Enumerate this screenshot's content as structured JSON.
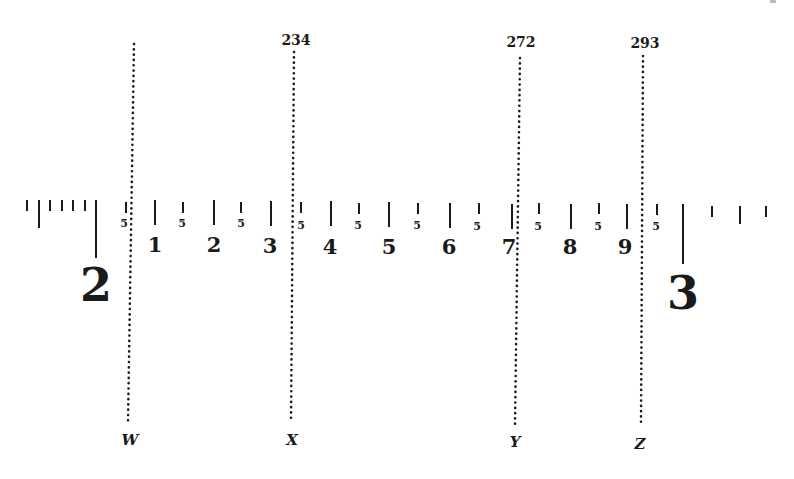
{
  "diagram": {
    "type": "scale-with-markers",
    "major_labels": [
      {
        "label": "2",
        "x": 95
      },
      {
        "label": "3",
        "x": 682
      }
    ],
    "minor_numbered": [
      {
        "label": "1",
        "x": 154
      },
      {
        "label": "2",
        "x": 213
      },
      {
        "label": "3",
        "x": 270
      },
      {
        "label": "4",
        "x": 330
      },
      {
        "label": "5",
        "x": 388
      },
      {
        "label": "6",
        "x": 449
      },
      {
        "label": "7",
        "x": 511
      },
      {
        "label": "8",
        "x": 570
      },
      {
        "label": "9",
        "x": 626
      }
    ],
    "half_ticks": [
      {
        "label": "5",
        "x": 125
      },
      {
        "label": "5",
        "x": 182
      },
      {
        "label": "5",
        "x": 240
      },
      {
        "label": "5",
        "x": 300
      },
      {
        "label": "5",
        "x": 358
      },
      {
        "label": "5",
        "x": 417
      },
      {
        "label": "5",
        "x": 478
      },
      {
        "label": "5",
        "x": 538
      },
      {
        "label": "5",
        "x": 598
      },
      {
        "label": "5",
        "x": 656
      }
    ],
    "markers": [
      {
        "letter": "W",
        "value": "",
        "x_top": 134,
        "x_bottom": 128
      },
      {
        "letter": "X",
        "value": "234",
        "x_top": 294,
        "x_bottom": 291
      },
      {
        "letter": "Y",
        "value": "272",
        "x_top": 520,
        "x_bottom": 515
      },
      {
        "letter": "Z",
        "value": "293",
        "x_top": 643,
        "x_bottom": 641
      }
    ]
  }
}
